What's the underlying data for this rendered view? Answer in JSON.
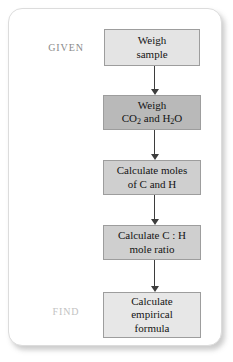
{
  "figure": {
    "type": "flowchart",
    "orientation": "vertical",
    "labels": {
      "given": "GIVEN",
      "find": "FIND"
    },
    "colors": {
      "card_background": "#ffffff",
      "card_border": "#dcdcdc",
      "box_border": "#9d9d9d",
      "arrow": "#3d3d3d",
      "given_label": "#8a8a8a",
      "find_label": "#c2c2c2"
    },
    "steps": [
      {
        "id": "weigh-sample",
        "lines": [
          "Weigh",
          "sample"
        ],
        "fill": "#e4e4e4"
      },
      {
        "id": "weigh-co2-h2o",
        "lines": [
          "Weigh",
          "CO2 and H2O"
        ],
        "line1": "Weigh",
        "line2_parts": [
          "CO",
          "2",
          " and H",
          "2",
          "O"
        ],
        "fill": "#b9b9b9"
      },
      {
        "id": "calculate-moles",
        "lines": [
          "Calculate moles",
          "of C and H"
        ],
        "fill": "#cfcfcf"
      },
      {
        "id": "calculate-mole-ratio",
        "lines": [
          "Calculate C : H",
          "mole ratio"
        ],
        "fill": "#cfcfcf"
      },
      {
        "id": "calculate-empirical-formula",
        "lines": [
          "Calculate",
          "empirical",
          "formula"
        ],
        "fill": "#e7e7e7"
      }
    ]
  }
}
